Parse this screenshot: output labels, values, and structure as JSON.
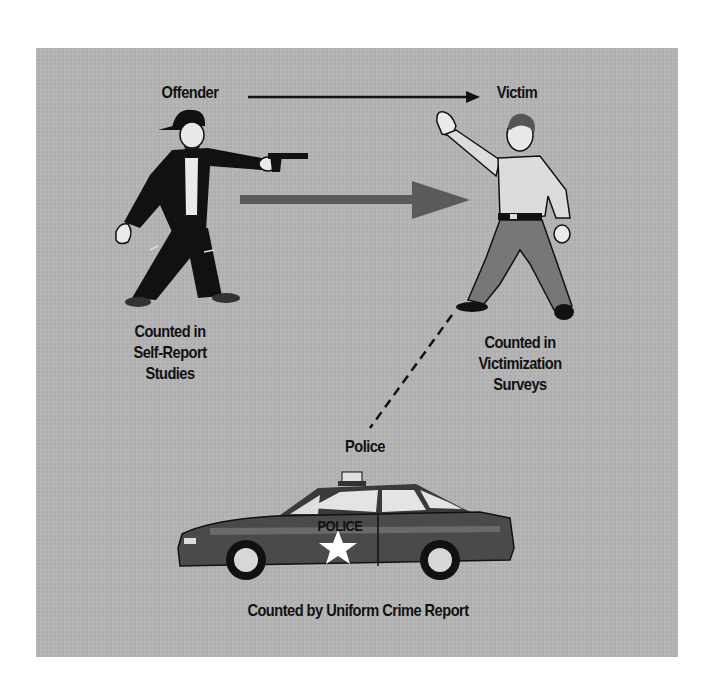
{
  "diagram": {
    "nodes": {
      "offender": {
        "label": "Offender",
        "caption_lines": [
          "Counted in",
          "Self-Report",
          "Studies"
        ]
      },
      "victim": {
        "label": "Victim",
        "caption_lines": [
          "Counted in",
          "Victimization",
          "Surveys"
        ]
      },
      "police": {
        "label": "Police",
        "car_text": "POLICE",
        "caption": "Counted by Uniform Crime Report"
      }
    },
    "edges": [
      {
        "from": "offender",
        "to": "victim",
        "style": "thin-arrow"
      },
      {
        "from": "offender",
        "to": "victim",
        "style": "thick-gray-arrow"
      },
      {
        "from": "victim",
        "to": "police",
        "style": "dashed-line"
      }
    ],
    "colors": {
      "panel": "#b4b4b4",
      "thick_arrow": "#5a5a5a",
      "ink": "#111111"
    }
  }
}
